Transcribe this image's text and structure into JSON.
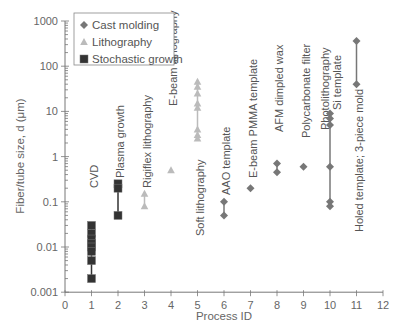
{
  "chart_data": {
    "type": "scatter",
    "title": "",
    "xlabel": "Process ID",
    "ylabel": "Fiber/tube size, d (μm)",
    "xlim": [
      0,
      12
    ],
    "ylim": [
      0.001,
      1000
    ],
    "yscale": "log",
    "grid": false,
    "legend_position": "upper left",
    "x_ticks": [
      "0",
      "1",
      "2",
      "3",
      "4",
      "5",
      "6",
      "7",
      "8",
      "9",
      "10",
      "11",
      "12"
    ],
    "y_ticks": [
      "0.001",
      "0.01",
      "0.1",
      "1",
      "10",
      "100",
      "1000"
    ],
    "legend": [
      {
        "name": "Cast molding",
        "marker": "diamond",
        "color": "#777777"
      },
      {
        "name": "Lithography",
        "marker": "triangle",
        "color": "#bbbbbb"
      },
      {
        "name": "Stochastic growth",
        "marker": "square",
        "color": "#333333"
      }
    ],
    "series": [
      {
        "name": "Stochastic growth",
        "marker": "square",
        "color": "#333333",
        "points": [
          {
            "x": 1,
            "ys": [
              0.03,
              0.02,
              0.015,
              0.012,
              0.01,
              0.008,
              0.005,
              0.002
            ],
            "label": "CVD"
          },
          {
            "x": 2,
            "ys": [
              0.25,
              0.2,
              0.05
            ],
            "label": "Plasma growth"
          }
        ]
      },
      {
        "name": "Lithography",
        "marker": "triangle",
        "color": "#bbbbbb",
        "points": [
          {
            "x": 3,
            "ys": [
              0.15,
              0.08
            ],
            "label": "Rigiflex lithography"
          },
          {
            "x": 4,
            "ys": [
              0.5
            ],
            "label": "E-beam lithography"
          },
          {
            "x": 5,
            "ys": [
              45,
              35,
              25,
              15,
              12,
              4,
              3,
              2.5
            ],
            "label": "Soft lithography"
          }
        ]
      },
      {
        "name": "Cast molding",
        "marker": "diamond",
        "color": "#777777",
        "points": [
          {
            "x": 6,
            "ys": [
              0.1,
              0.05
            ],
            "label": "AAO template"
          },
          {
            "x": 7,
            "ys": [
              0.2
            ],
            "label": "E-beam PMMA template"
          },
          {
            "x": 8,
            "ys": [
              0.7,
              0.45
            ],
            "label": "AFM dimpled wax"
          },
          {
            "x": 9,
            "ys": [
              0.6
            ],
            "label": "Polycarbonate filter"
          },
          {
            "x": 10,
            "ys": [
              9,
              7,
              5,
              0.6,
              0.1,
              0.08
            ],
            "label": "Photolithography Si template"
          },
          {
            "x": 11,
            "ys": [
              360,
              40
            ],
            "label": "Holed template; 3-piece mold"
          }
        ]
      }
    ],
    "annotations": [
      {
        "text": "CVD",
        "x": 1
      },
      {
        "text": "Plasma growth",
        "x": 2
      },
      {
        "text": "Rigiflex lithography",
        "x": 3
      },
      {
        "text": "E-beam lithography",
        "x": 4
      },
      {
        "text": "Soft lithography",
        "x": 5
      },
      {
        "text": "AAO template",
        "x": 6
      },
      {
        "text": "E-beam PMMA template",
        "x": 7
      },
      {
        "text": "AFM dimpled wax",
        "x": 8
      },
      {
        "text": "Polycarbonate filter",
        "x": 9
      },
      {
        "text": "Photolithography",
        "x": 10
      },
      {
        "text": "Si template",
        "x": 10
      },
      {
        "text": "Holed template; 3-piece mold",
        "x": 11
      }
    ]
  }
}
